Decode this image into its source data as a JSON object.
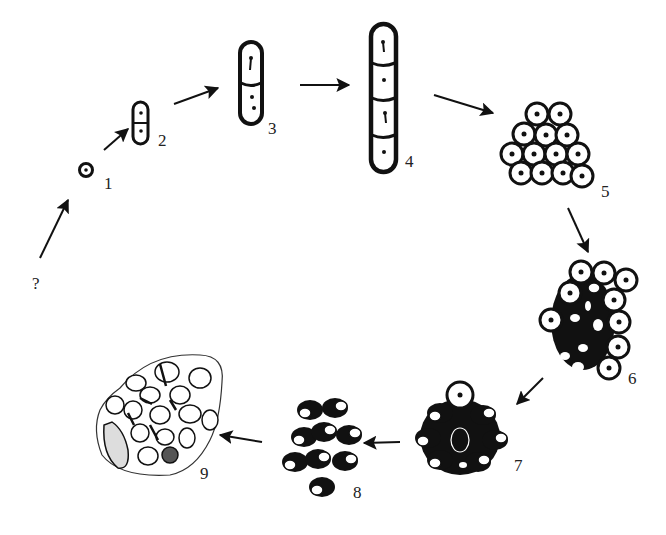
{
  "diagram": {
    "type": "life-cycle",
    "colors": {
      "ink": "#111111",
      "background": "#ffffff",
      "label": "#222222"
    },
    "start_label": "?",
    "stages": [
      {
        "id": 1,
        "label": "1",
        "form": "single cell"
      },
      {
        "id": 2,
        "label": "2",
        "form": "two-cell chain"
      },
      {
        "id": 3,
        "label": "3",
        "form": "two-cell elongated chain"
      },
      {
        "id": 4,
        "label": "4",
        "form": "four-cell chain"
      },
      {
        "id": 5,
        "label": "5",
        "form": "cluster of round cells"
      },
      {
        "id": 6,
        "label": "6",
        "form": "cluster with darkening cells"
      },
      {
        "id": 7,
        "label": "7",
        "form": "dark cluster"
      },
      {
        "id": 8,
        "label": "8",
        "form": "dispersed dark cells"
      },
      {
        "id": 9,
        "label": "9",
        "form": "cells enclosed in membrane"
      }
    ],
    "arrows": [
      {
        "from": "?",
        "to": "1"
      },
      {
        "from": "1",
        "to": "2"
      },
      {
        "from": "2",
        "to": "3"
      },
      {
        "from": "3",
        "to": "4"
      },
      {
        "from": "4",
        "to": "5"
      },
      {
        "from": "5",
        "to": "6"
      },
      {
        "from": "6",
        "to": "7"
      },
      {
        "from": "7",
        "to": "8"
      },
      {
        "from": "8",
        "to": "9"
      }
    ]
  }
}
